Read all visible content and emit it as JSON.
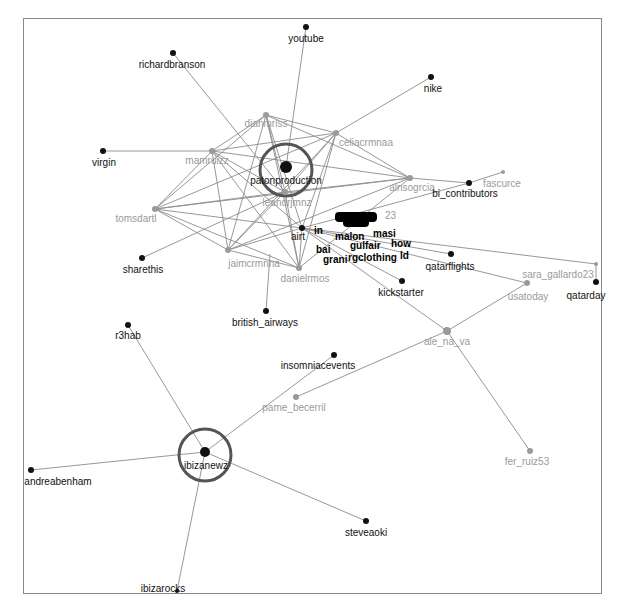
{
  "colors": {
    "edge": "#8c8c8c",
    "dark_node": "#111111",
    "grey_node": "#9a9a9a",
    "highlight_ring": "#555555",
    "frame": "#8a8a8a"
  },
  "nodes": [
    {
      "id": "youtube",
      "label": "youtube",
      "x": 306,
      "y": 27,
      "r": 3,
      "type": "dark",
      "lx": 306,
      "ly": 33
    },
    {
      "id": "richardbranson",
      "label": "richardbranson",
      "x": 173,
      "y": 53,
      "r": 3,
      "type": "dark",
      "lx": 172,
      "ly": 59
    },
    {
      "id": "nike",
      "label": "nike",
      "x": 431,
      "y": 77,
      "r": 3,
      "type": "dark",
      "lx": 433,
      "ly": 83
    },
    {
      "id": "dianmrlss",
      "label": "dianmrlss",
      "x": 266,
      "y": 115,
      "r": 3,
      "type": "grey",
      "lx": 266,
      "ly": 118
    },
    {
      "id": "celiacrmnaa",
      "label": "celiacrmnaa",
      "x": 336,
      "y": 133,
      "r": 3,
      "type": "grey",
      "lx": 366,
      "ly": 137
    },
    {
      "id": "mamruizz",
      "label": "mamruizz",
      "x": 212,
      "y": 151,
      "r": 3,
      "type": "grey",
      "lx": 207,
      "ly": 155
    },
    {
      "id": "virgin",
      "label": "virgin",
      "x": 103,
      "y": 151,
      "r": 3,
      "type": "dark",
      "lx": 104,
      "ly": 157
    },
    {
      "id": "patonproduction",
      "label": "patonproduction",
      "x": 286,
      "y": 167,
      "r": 6,
      "type": "dark",
      "ring": 26,
      "lx": 286,
      "ly": 175
    },
    {
      "id": "fascurce",
      "label": "fascurce",
      "x": 503,
      "y": 172,
      "r": 2,
      "type": "grey",
      "lx": 502,
      "ly": 178
    },
    {
      "id": "alnsogrciaa",
      "label": "alnsogrcia",
      "x": 410,
      "y": 178,
      "r": 3,
      "type": "grey",
      "lx": 412,
      "ly": 182
    },
    {
      "id": "bi_contributors",
      "label": "bi_contributors",
      "x": 469,
      "y": 183,
      "r": 3,
      "type": "dark",
      "lx": 465,
      "ly": 188
    },
    {
      "id": "leandrjmnz",
      "label": "leandrjmnz",
      "x": 285,
      "y": 192,
      "r": 3,
      "type": "grey",
      "lx": 287,
      "ly": 197
    },
    {
      "id": "tomsdartl",
      "label": "tomsdartl",
      "x": 155,
      "y": 209,
      "r": 3,
      "type": "grey",
      "lx": 136,
      "ly": 213
    },
    {
      "id": "airt",
      "label": "airt",
      "x": 302,
      "y": 228,
      "r": 3,
      "type": "dark",
      "lx": 298,
      "ly": 231
    },
    {
      "id": "sharethis",
      "label": "sharethis",
      "x": 142,
      "y": 258,
      "r": 3,
      "type": "dark",
      "lx": 143,
      "ly": 264
    },
    {
      "id": "jaimcrmnna",
      "label": "jaimcrmnna",
      "x": 228,
      "y": 250,
      "r": 3,
      "type": "grey",
      "lx": 254,
      "ly": 258
    },
    {
      "id": "qatarflights",
      "label": "qatarflights",
      "x": 451,
      "y": 254,
      "r": 3,
      "type": "dark",
      "lx": 450,
      "ly": 261
    },
    {
      "id": "sara_gallardo23",
      "label": "sara_gallardo23",
      "x": 596,
      "y": 264,
      "r": 2,
      "type": "grey",
      "lx": 558,
      "ly": 269
    },
    {
      "id": "danielrmos",
      "label": "danielrmos",
      "x": 299,
      "y": 268,
      "r": 3,
      "type": "grey",
      "lx": 305,
      "ly": 273
    },
    {
      "id": "usatoday",
      "label": "usatoday",
      "x": 527,
      "y": 283,
      "r": 3,
      "type": "grey",
      "lx": 528,
      "ly": 291
    },
    {
      "id": "qatarday",
      "label": "qatarday",
      "x": 596,
      "y": 282,
      "r": 3,
      "type": "dark",
      "lx": 586,
      "ly": 290
    },
    {
      "id": "kickstarter",
      "label": "kickstarter",
      "x": 402,
      "y": 281,
      "r": 3,
      "type": "dark",
      "lx": 401,
      "ly": 287
    },
    {
      "id": "british_airways",
      "label": "british_airways",
      "x": 266,
      "y": 311,
      "r": 3,
      "type": "dark",
      "lx": 265,
      "ly": 317
    },
    {
      "id": "r3hab",
      "label": "r3hab",
      "x": 128,
      "y": 325,
      "r": 3,
      "type": "dark",
      "lx": 128,
      "ly": 330
    },
    {
      "id": "ale_na_va",
      "label": "ale_na_va",
      "x": 447,
      "y": 331,
      "r": 4,
      "type": "grey",
      "lx": 447,
      "ly": 336
    },
    {
      "id": "insomniaevents",
      "label": "insomniacevents",
      "x": 334,
      "y": 355,
      "r": 3,
      "type": "dark",
      "lx": 318,
      "ly": 360
    },
    {
      "id": "pame_becerril",
      "label": "pame_becerril",
      "x": 296,
      "y": 397,
      "r": 3,
      "type": "grey",
      "lx": 294,
      "ly": 402
    },
    {
      "id": "ibizanewz",
      "label": "ibizanewz",
      "x": 205,
      "y": 452,
      "r": 5,
      "type": "dark",
      "ring": 26,
      "lx": 206,
      "ly": 460
    },
    {
      "id": "andreabenham",
      "label": "andreabenham",
      "x": 31,
      "y": 470,
      "r": 3,
      "type": "dark",
      "lx": 58,
      "ly": 476
    },
    {
      "id": "fer_ruiz53",
      "label": "fer_ruiz53",
      "x": 530,
      "y": 451,
      "r": 3,
      "type": "grey",
      "lx": 527,
      "ly": 456
    },
    {
      "id": "steveaoki",
      "label": "steveaoki",
      "x": 366,
      "y": 521,
      "r": 3,
      "type": "dark",
      "lx": 366,
      "ly": 527
    },
    {
      "id": "ibizarocks",
      "label": "ibizarocks",
      "x": 177,
      "y": 591,
      "r": 2,
      "type": "dark",
      "lx": 163,
      "ly": 583
    }
  ],
  "cluster": {
    "fragments": [
      "in",
      "malon",
      "masi",
      "gulfair",
      "how",
      "bai",
      "grani",
      "rgclothing",
      "ld",
      "23"
    ]
  },
  "edges": [
    [
      "youtube",
      "patonproduction"
    ],
    [
      "richardbranson",
      "leandrjmnz"
    ],
    [
      "nike",
      "celiacrmnaa"
    ],
    [
      "virgin",
      "mamruizz"
    ],
    [
      "sharethis",
      "leandrjmnz"
    ],
    [
      "british_airways",
      "danielrmos_top"
    ],
    [
      "dianmrlss",
      "celiacrmnaa"
    ],
    [
      "dianmrlss",
      "mamruizz"
    ],
    [
      "dianmrlss",
      "alnsogrciaa"
    ],
    [
      "dianmrlss",
      "tomsdartl"
    ],
    [
      "dianmrlss",
      "jaimcrmnna"
    ],
    [
      "dianmrlss",
      "danielrmos"
    ],
    [
      "dianmrlss",
      "leandrjmnz"
    ],
    [
      "dianmrlss",
      "airt"
    ],
    [
      "celiacrmnaa",
      "mamruizz"
    ],
    [
      "celiacrmnaa",
      "alnsogrciaa"
    ],
    [
      "celiacrmnaa",
      "tomsdartl"
    ],
    [
      "celiacrmnaa",
      "jaimcrmnna"
    ],
    [
      "celiacrmnaa",
      "danielrmos"
    ],
    [
      "celiacrmnaa",
      "leandrjmnz"
    ],
    [
      "celiacrmnaa",
      "airt"
    ],
    [
      "mamruizz",
      "alnsogrciaa"
    ],
    [
      "mamruizz",
      "tomsdartl"
    ],
    [
      "mamruizz",
      "jaimcrmnna"
    ],
    [
      "mamruizz",
      "danielrmos"
    ],
    [
      "mamruizz",
      "leandrjmnz"
    ],
    [
      "mamruizz",
      "airt"
    ],
    [
      "alnsogrciaa",
      "tomsdartl"
    ],
    [
      "alnsogrciaa",
      "jaimcrmnna"
    ],
    [
      "alnsogrciaa",
      "danielrmos"
    ],
    [
      "alnsogrciaa",
      "leandrjmnz"
    ],
    [
      "alnsogrciaa",
      "bi_contributors"
    ],
    [
      "tomsdartl",
      "jaimcrmnna"
    ],
    [
      "tomsdartl",
      "danielrmos"
    ],
    [
      "tomsdartl",
      "leandrjmnz"
    ],
    [
      "tomsdartl",
      "airt"
    ],
    [
      "jaimcrmnna",
      "danielrmos"
    ],
    [
      "jaimcrmnna",
      "leandrjmnz"
    ],
    [
      "jaimcrmnna",
      "airt"
    ],
    [
      "danielrmos",
      "leandrjmnz"
    ],
    [
      "danielrmos",
      "airt"
    ],
    [
      "bi_contributors",
      "fascurce"
    ],
    [
      "bi_contributors",
      "airt"
    ],
    [
      "qatarflights",
      "airt"
    ],
    [
      "usatoday",
      "airt"
    ],
    [
      "sara_gallardo23",
      "airt"
    ],
    [
      "qatarday",
      "sara_gallardo23"
    ],
    [
      "kickstarter",
      "airt"
    ],
    [
      "ale_na_va",
      "airt"
    ],
    [
      "ale_na_va",
      "fer_ruiz53"
    ],
    [
      "ale_na_va",
      "pame_becerril"
    ],
    [
      "usatoday",
      "ale_na_va"
    ],
    [
      "r3hab",
      "ibizanewz"
    ],
    [
      "andreabenham",
      "ibizanewz"
    ],
    [
      "steveaoki",
      "ibizanewz"
    ],
    [
      "ibizarocks",
      "ibizanewz"
    ],
    [
      "insomniaevents",
      "ibizanewz"
    ]
  ]
}
